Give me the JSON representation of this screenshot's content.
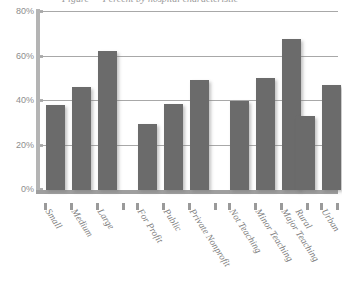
{
  "chart_data": {
    "type": "bar",
    "title": "",
    "xlabel": "",
    "ylabel": "",
    "ylim": [
      0,
      80
    ],
    "ytick_labels": [
      "80%",
      "60%",
      "40%",
      "20%",
      "0%"
    ],
    "ytick_values": [
      80,
      60,
      40,
      20,
      0
    ],
    "grid": true,
    "legend": "none",
    "categories": [
      "Small",
      "Medium",
      "Large",
      "For Profit",
      "Public",
      "Private Nonprofit",
      "Not Teaching",
      "Minor Teaching",
      "Major Teaching",
      "Rural",
      "Urban"
    ],
    "values": [
      38,
      46,
      62,
      29.5,
      38.5,
      49,
      40,
      50,
      67.5,
      33,
      47
    ],
    "groups": [
      {
        "name": "Hospital Size",
        "categories": [
          "Small",
          "Medium",
          "Large"
        ],
        "values": [
          38,
          46,
          62
        ]
      },
      {
        "name": "Ownership",
        "categories": [
          "For Profit",
          "Public",
          "Private Nonprofit"
        ],
        "values": [
          29.5,
          38.5,
          49
        ]
      },
      {
        "name": "Teaching Status",
        "categories": [
          "Not Teaching",
          "Minor Teaching",
          "Major Teaching"
        ],
        "values": [
          40,
          50,
          67.5
        ]
      },
      {
        "name": "Location",
        "categories": [
          "Rural",
          "Urban"
        ],
        "values": [
          33,
          47
        ]
      }
    ],
    "bar_color": "#6b6b6b",
    "grid_color": "#a8a8a8",
    "axis_color": "#9e9e9e",
    "label_color": "#7c7c7c",
    "units": "percent"
  },
  "title_fragment": {
    "text": "Figure — Percent by hospital characteristic"
  }
}
